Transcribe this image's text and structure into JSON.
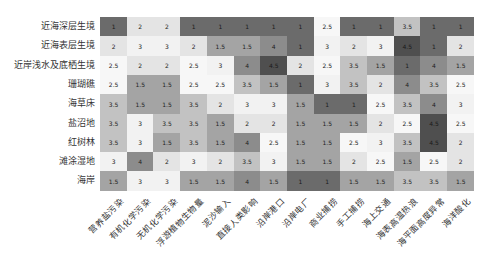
{
  "chart_data": {
    "type": "heatmap",
    "title": "",
    "xlabel": "",
    "ylabel": "",
    "rows": [
      "近海深层生境",
      "近海表层生境",
      "近岸浅水及底栖生境",
      "珊瑚礁",
      "海草床",
      "盐沼地",
      "红树林",
      "滩涂湿地",
      "海岸"
    ],
    "columns": [
      "营养盐污染",
      "有机化学污染",
      "无机化学污染",
      "浮游植物生物量",
      "泥沙输入",
      "直接人类影响",
      "沿岸港口",
      "沿岸电厂",
      "商业捕捞",
      "手工捕捞",
      "海上交通",
      "海表高温热浪",
      "海平面高度异常",
      "海洋酸化"
    ],
    "values": [
      [
        1,
        2,
        2,
        1,
        1,
        1,
        1,
        1,
        2.5,
        1,
        1,
        3.5,
        1,
        1
      ],
      [
        2,
        3,
        3,
        2,
        1.5,
        1.5,
        4,
        1,
        3,
        2,
        3,
        4.5,
        1,
        2
      ],
      [
        2.5,
        2,
        2,
        2.5,
        3,
        4,
        4.5,
        2,
        2.5,
        3.5,
        1.5,
        1,
        4,
        1.5
      ],
      [
        2.5,
        1.5,
        1.5,
        2.5,
        2.5,
        3.5,
        1.5,
        1,
        3,
        3.5,
        2,
        4,
        3.5,
        2.5
      ],
      [
        3.5,
        1.5,
        1.5,
        3.5,
        2,
        3,
        3,
        1.5,
        1,
        1,
        2.5,
        3.5,
        4,
        3
      ],
      [
        3.5,
        3,
        3.5,
        3.5,
        1.5,
        2,
        2,
        1.5,
        1.5,
        1.5,
        2,
        2.5,
        4.5,
        2.5
      ],
      [
        3.5,
        3,
        1.5,
        3.5,
        1.5,
        4,
        2.5,
        1.5,
        1.5,
        2.5,
        3,
        3.5,
        4.5,
        2
      ],
      [
        3,
        4,
        2,
        3,
        2,
        3.5,
        3,
        1.5,
        1.5,
        2,
        2.5,
        1.5,
        2.5,
        2
      ],
      [
        1.5,
        3,
        3,
        1.5,
        1.5,
        4,
        1.5,
        1,
        1,
        1.5,
        1.5,
        3.5,
        3.5,
        1.5
      ]
    ],
    "value_range": [
      1,
      4.5
    ],
    "colormap": "diverging gray (dark at 1 and 4.5, white near 2.5-3)",
    "legend": "none",
    "grid": false
  },
  "colors": {
    "1": "#6b6b6b",
    "1.5": "#a4a4a4",
    "2": "#e4e4e4",
    "2.5": "#f7f7f7",
    "3": "#f2f2f2",
    "3.5": "#c2c2c2",
    "4": "#8c8c8c",
    "4.5": "#4f4f4f"
  }
}
